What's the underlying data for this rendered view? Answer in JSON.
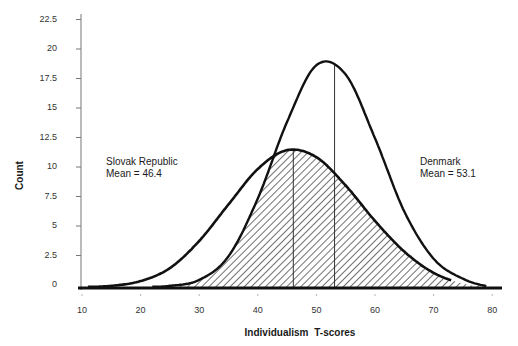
{
  "chart_data": {
    "type": "area",
    "title": "",
    "xlabel": "Individualism  T-scores",
    "ylabel": "Count",
    "xlim": [
      10,
      80
    ],
    "ylim": [
      0,
      22.5
    ],
    "grid": false,
    "x_ticks": [
      "10",
      "20",
      "30",
      "40",
      "50",
      "60",
      "70",
      "80"
    ],
    "y_ticks": [
      "0",
      "2.5",
      "5",
      "7.5",
      "10",
      "12.5",
      "15",
      "17.5",
      "20",
      "22.5"
    ],
    "x": [
      10,
      15,
      20,
      25,
      30,
      35,
      40,
      45,
      50,
      55,
      60,
      65,
      70,
      75,
      80
    ],
    "series": [
      {
        "name": "Slovak Republic",
        "mean": 46.4,
        "mean_label": "Mean = 46.4",
        "values": [
          0.0,
          0.1,
          0.5,
          1.6,
          3.9,
          7.0,
          10.0,
          11.6,
          11.0,
          8.6,
          5.6,
          3.0,
          1.2,
          0.3,
          0.0
        ],
        "style": "solid-line"
      },
      {
        "name": "Denmark",
        "mean": 53.1,
        "mean_label": "Mean = 53.1",
        "values": [
          0.0,
          0.0,
          0.0,
          0.1,
          0.6,
          2.6,
          7.5,
          14.0,
          18.8,
          18.0,
          12.6,
          6.4,
          2.4,
          0.7,
          0.0
        ],
        "style": "solid-line"
      }
    ],
    "overlap_region": "hatched",
    "annotations": [
      {
        "text": "Slovak Republic",
        "sub": "Mean = 46.4",
        "x": 12,
        "y": 11.2
      },
      {
        "text": "Denmark",
        "sub": "Mean = 53.1",
        "x": 68,
        "y": 11.2
      }
    ],
    "legend": "none (inline labels)"
  },
  "labels": {
    "ylabel": "Count",
    "xlabel": "Individualism  T-scores",
    "slovak_name": "Slovak Republic",
    "slovak_mean": "Mean = 46.4",
    "denmark_name": "Denmark",
    "denmark_mean": "Mean = 53.1"
  },
  "colors": {
    "line": "#111111",
    "axis": "#555555",
    "hatch": "#222222"
  }
}
